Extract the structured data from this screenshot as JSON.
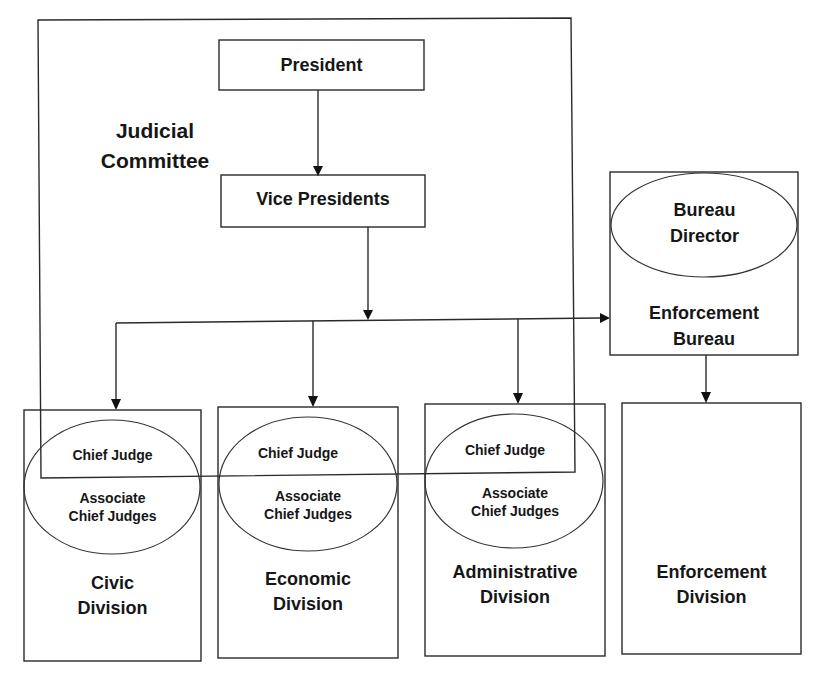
{
  "diagram": {
    "type": "organization-chart",
    "committee": {
      "label_line1": "Judicial",
      "label_line2": "Committee"
    },
    "president": {
      "label": "President"
    },
    "vice_presidents": {
      "label": "Vice Presidents"
    },
    "enforcement_bureau": {
      "director_line1": "Bureau",
      "director_line2": "Director",
      "name_line1": "Enforcement",
      "name_line2": "Bureau"
    },
    "divisions": [
      {
        "chief": "Chief Judge",
        "associate_line1": "Associate",
        "associate_line2": "Chief Judges",
        "name_line1": "Civic",
        "name_line2": "Division"
      },
      {
        "chief": "Chief Judge",
        "associate_line1": "Associate",
        "associate_line2": "Chief Judges",
        "name_line1": "Economic",
        "name_line2": "Division"
      },
      {
        "chief": "Chief Judge",
        "associate_line1": "Associate",
        "associate_line2": "Chief Judges",
        "name_line1": "Administrative",
        "name_line2": "Division"
      },
      {
        "name_line1": "Enforcement",
        "name_line2": "Division"
      }
    ],
    "colors": {
      "line": "#2a2a2a",
      "text": "#161616",
      "background": "#ffffff"
    }
  }
}
